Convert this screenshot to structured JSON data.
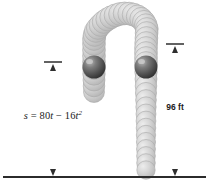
{
  "figure": {
    "background_color": "#ffffff",
    "ground": {
      "color": "#2b2b2b",
      "y": 177,
      "x_start": 3,
      "x_end": 206
    },
    "labels": {
      "equation_plain": "s = 80t - 16t²",
      "equation_lhs": "s",
      "equation_eq": "=",
      "equation_coeff_linear": "80",
      "equation_var": "t",
      "equation_minus": "−",
      "equation_coeff_quadratic": "16",
      "equation_exponent": "2",
      "height_label": "96 ft",
      "height_value": "96",
      "height_unit": "ft"
    },
    "dimension_lines": [
      {
        "name": "height-dimension-left",
        "label": "s = 80t − 16t²",
        "x": 53,
        "y_top": 62,
        "y_bottom": 176,
        "has_top_tick": true,
        "arrow_top": true,
        "arrow_bottom": true,
        "color": "#4d4d4d"
      },
      {
        "name": "height-dimension-right",
        "label": "96 ft",
        "x": 175,
        "y_top": 44,
        "y_bottom": 176,
        "has_top_tick": true,
        "arrow_top": true,
        "arrow_bottom": true,
        "color": "#4d4d4d"
      }
    ],
    "balls": [
      {
        "name": "ball-ascending",
        "cx": 94,
        "cy": 67,
        "r": 11.5,
        "fill": "#5a5a5a"
      },
      {
        "name": "ball-descending",
        "cx": 146,
        "cy": 67,
        "r": 11.5,
        "fill": "#5a5a5a"
      }
    ],
    "trail": {
      "description": "overlapping spheres tracing an inverted-U projectile path",
      "fill": "#c9c9c9",
      "stroke": "#a8a8a8",
      "left_column_bottom_y": 96,
      "right_column_bottom_y": 176,
      "arch_apex_y": 13
    }
  }
}
